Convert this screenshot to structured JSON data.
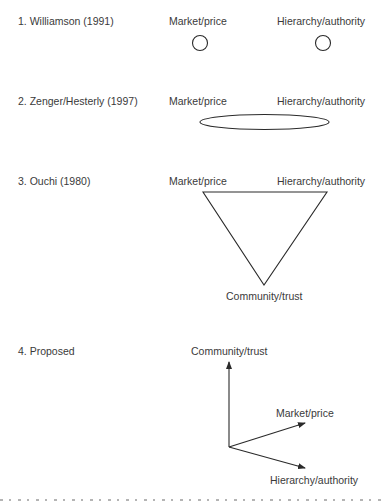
{
  "panels": [
    {
      "title": "1. Williamson (1991)",
      "labels": {
        "market": "Market/price",
        "hierarchy": "Hierarchy/authority"
      },
      "shape": "two separate circles"
    },
    {
      "title": "2. Zenger/Hesterly (1997)",
      "labels": {
        "market": "Market/price",
        "hierarchy": "Hierarchy/authority"
      },
      "shape": "single ellipse spanning both"
    },
    {
      "title": "3. Ouchi (1980)",
      "labels": {
        "market": "Market/price",
        "hierarchy": "Hierarchy/authority",
        "community": "Community/trust"
      },
      "shape": "inverted triangle"
    },
    {
      "title": "4. Proposed",
      "labels": {
        "community": "Community/trust",
        "market": "Market/price",
        "hierarchy": "Hierarchy/authority"
      },
      "shape": "three axes (vectors) from common origin"
    }
  ],
  "colors": {
    "stroke": "#2a2a2a",
    "text": "#3a3a3a",
    "background": "#ffffff"
  }
}
